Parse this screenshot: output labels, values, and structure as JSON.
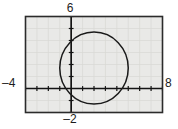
{
  "figure": {
    "kind": "graphing-calculator-plot",
    "background_color": "#ffffff",
    "plot_background_color": "#e9e9e7",
    "frame_color": "#2b2b2b",
    "curve_color": "#1a1a1a",
    "axis_color": "#141414",
    "grid_color": "#d8d8d4"
  },
  "labels": {
    "top": "6",
    "left": "–4",
    "right": "8",
    "bottom": "–2"
  },
  "chart_data": {
    "type": "scatter",
    "title": "",
    "subtitle": "",
    "xlabel": "",
    "ylabel": "",
    "xlim": [
      -4,
      8
    ],
    "ylim": [
      -2,
      6
    ],
    "grid": true,
    "legend": null,
    "legend_position": "none",
    "axis_tick_labels": {
      "xmin": "–4",
      "xmax": "8",
      "ymax": "6",
      "ymin": "–2"
    },
    "tick_spacing": {
      "x": 1,
      "y": 1
    },
    "axes_drawn_at": {
      "x": 0,
      "y": 0
    },
    "series": [
      {
        "name": "circle",
        "shape": "circle",
        "center": [
          2,
          1.7
        ],
        "radius": 3,
        "equation": "(x – 2)² + (y – 1.7)² = 3²",
        "stroke": "#1a1a1a",
        "fill": "none",
        "points": [
          [
            5.0,
            1.7
          ],
          [
            4.87,
            2.48
          ],
          [
            4.48,
            3.17
          ],
          [
            3.89,
            3.71
          ],
          [
            3.15,
            4.04
          ],
          [
            2.35,
            4.15
          ],
          [
            1.55,
            4.02
          ],
          [
            0.86,
            3.66
          ],
          [
            0.34,
            3.1
          ],
          [
            0.05,
            2.41
          ],
          [
            0.01,
            1.67
          ],
          [
            0.21,
            0.94
          ],
          [
            0.63,
            0.31
          ],
          [
            1.23,
            -0.13
          ],
          [
            1.94,
            -0.32
          ],
          [
            2.67,
            -0.25
          ],
          [
            3.36,
            0.06
          ],
          [
            3.92,
            0.59
          ],
          [
            4.32,
            1.27
          ],
          [
            4.46,
            1.7
          ]
        ]
      }
    ]
  }
}
